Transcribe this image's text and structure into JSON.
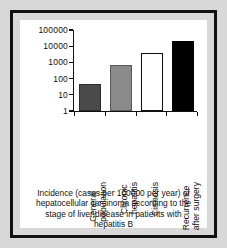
{
  "figure": {
    "background_color": "#d8d8d8",
    "frame_color": "#111111",
    "panel_color": "#ffffff"
  },
  "caption": {
    "lines": [
      "Incidence (cases per 100000 per year) of",
      "hepatocellular carcinoma according to the",
      "stage of liver disease in patients with",
      "hepatitis B"
    ]
  },
  "chart_data": {
    "type": "bar",
    "title": "",
    "xlabel": "",
    "ylabel": "",
    "yscale": "log",
    "ylim": [
      1,
      100000
    ],
    "grid": false,
    "legend": "none",
    "categories": [
      "General population",
      "Chronic hepatitis",
      "Cirrhosis",
      "Recurrence after surgery"
    ],
    "category_lines": [
      [
        "General",
        "population"
      ],
      [
        "Chronic",
        "hepatitis"
      ],
      [
        "Cirrhosis",
        ""
      ],
      [
        "Recurrence",
        "after surgery"
      ]
    ],
    "values": [
      45,
      700,
      4000,
      20000
    ],
    "bar_colors": [
      "#4a4a4a",
      "#8a8a8a",
      "#ffffff",
      "#000000"
    ],
    "bar_edge_colors": [
      "#2b2b2b",
      "#5a5a5a",
      "#111111",
      "#000000"
    ],
    "ytick_labels": [
      "100000",
      "10000",
      "1000",
      "100",
      "10",
      "1"
    ],
    "ytick_values": [
      100000,
      10000,
      1000,
      100,
      10,
      1
    ]
  }
}
